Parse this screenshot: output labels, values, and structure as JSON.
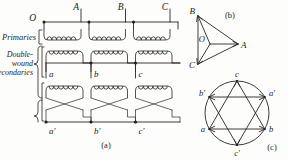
{
  "figure": {
    "background_color": "#fdfdfb",
    "ink_color": "#2a2522"
  },
  "panel_a": {
    "caption": "(a)",
    "side_labels": {
      "primaries": "Primaries",
      "secondaries_line1": "Double-",
      "secondaries_line2": "wound",
      "secondaries_line3": "secondaries"
    },
    "terminals_top": [
      {
        "name": "star-point-o",
        "label": "O"
      },
      {
        "name": "terminal-a",
        "label": "A"
      },
      {
        "name": "terminal-b",
        "label": "B"
      },
      {
        "name": "terminal-c",
        "label": "C"
      }
    ],
    "secondary_labels_upper": [
      {
        "name": "secondary-a",
        "label": "a"
      },
      {
        "name": "secondary-b",
        "label": "b"
      },
      {
        "name": "secondary-c",
        "label": "c"
      }
    ],
    "secondary_labels_lower": [
      {
        "name": "secondary-a-prime",
        "label": "a′"
      },
      {
        "name": "secondary-b-prime",
        "label": "b′"
      },
      {
        "name": "secondary-c-prime",
        "label": "c′"
      }
    ],
    "winding_rows": [
      {
        "name": "primary-windings",
        "count": 3
      },
      {
        "name": "secondary-windings-upper",
        "count": 3
      },
      {
        "name": "secondary-windings-lower",
        "count": 3
      }
    ]
  },
  "panel_b": {
    "caption": "(b)",
    "type": "vector-diagram",
    "origin_label": "O",
    "vectors": [
      {
        "name": "vector-a",
        "label": "A",
        "angle_deg": 0
      },
      {
        "name": "vector-b",
        "label": "B",
        "angle_deg": 120
      },
      {
        "name": "vector-c",
        "label": "C",
        "angle_deg": 240
      }
    ]
  },
  "panel_c": {
    "caption": "(c)",
    "type": "hexagram-vector-diagram",
    "vertices": [
      {
        "name": "vertex-c",
        "label": "c",
        "position": "top"
      },
      {
        "name": "vertex-a-prime",
        "label": "a′",
        "position": "upper-right"
      },
      {
        "name": "vertex-b",
        "label": "b",
        "position": "lower-right"
      },
      {
        "name": "vertex-c-prime",
        "label": "c′",
        "position": "bottom"
      },
      {
        "name": "vertex-a",
        "label": "a",
        "position": "lower-left"
      },
      {
        "name": "vertex-b-prime",
        "label": "b′",
        "position": "upper-left"
      }
    ]
  }
}
